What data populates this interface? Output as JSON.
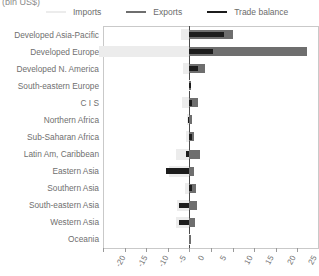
{
  "title": "(bln US$)",
  "legend": {
    "position": "top",
    "items": [
      {
        "label": "Imports",
        "color": "#ececec",
        "name": "legend-imports"
      },
      {
        "label": "Exports",
        "color": "#6e6e6e",
        "name": "legend-exports"
      },
      {
        "label": "Trade balance",
        "color": "#1c1c1c",
        "name": "legend-trade-balance"
      }
    ]
  },
  "chart_data": {
    "type": "bar",
    "orientation": "horizontal",
    "title": "(bln US$)",
    "xlabel": "",
    "ylabel": "",
    "xlim": [
      -20,
      30
    ],
    "xticks": [
      -20,
      -15,
      -10,
      -5,
      0,
      5,
      10,
      15,
      20,
      25,
      30
    ],
    "xtick_labels": [
      "-20",
      "-15",
      "-10",
      "-5",
      "0",
      "5",
      "10",
      "15",
      "20",
      "25",
      "30"
    ],
    "grid": false,
    "legend_position": "top",
    "categories": [
      "Developed Asia-Pacific",
      "Developed Europe",
      "Developed N. America",
      "South-eastern Europe",
      "C I S",
      "Northern Africa",
      "Sub-Saharan Africa",
      "Latin Am, Caribbean",
      "Eastern Asia",
      "Southern Asia",
      "South-eastern Asia",
      "Western Asia",
      "Oceania"
    ],
    "series": [
      {
        "name": "Imports",
        "color": "#ececec",
        "values": [
          -2.0,
          -21.0,
          -1.5,
          -0.2,
          -1.6,
          -0.5,
          -0.9,
          -3.1,
          -4.8,
          -1.0,
          -2.9,
          -3.0,
          -0.1
        ]
      },
      {
        "name": "Exports",
        "color": "#6e6e6e",
        "values": [
          10.0,
          27.2,
          3.6,
          0.3,
          1.9,
          0.5,
          1.1,
          2.4,
          1.1,
          1.6,
          1.8,
          1.3,
          0.1
        ]
      },
      {
        "name": "Trade balance",
        "color": "#1c1c1c",
        "values": [
          8.0,
          5.5,
          2.1,
          0.1,
          0.7,
          -0.3,
          0.6,
          -0.7,
          -5.5,
          0.6,
          -2.4,
          -2.5,
          0.0
        ]
      }
    ]
  }
}
